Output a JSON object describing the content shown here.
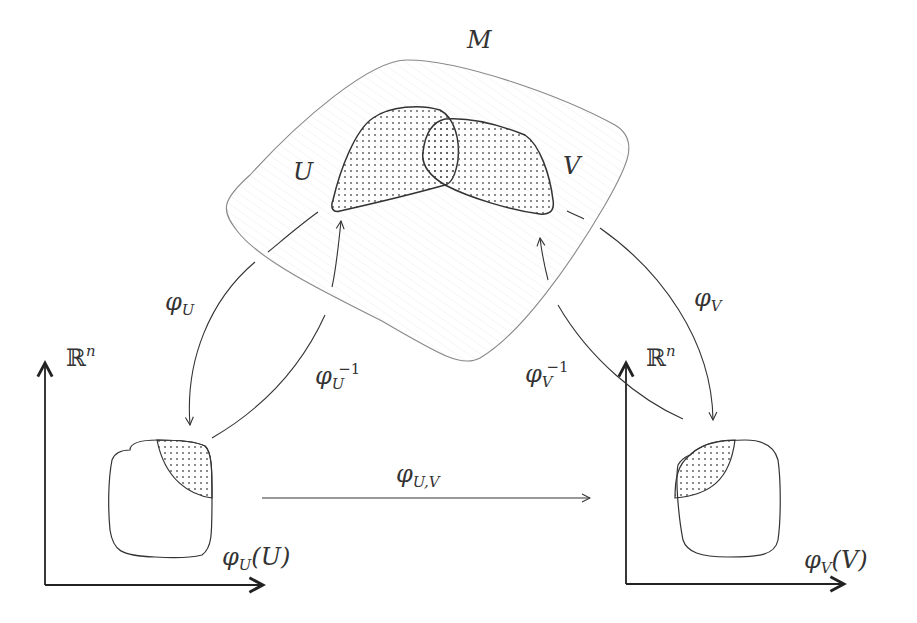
{
  "diagram": {
    "manifold_label": "M",
    "open_set_u_label": "U",
    "open_set_v_label": "V",
    "chart_u": {
      "map": "φ",
      "sub": "U"
    },
    "chart_u_inverse": {
      "map": "φ",
      "sub": "U",
      "sup": "−1"
    },
    "chart_v": {
      "map": "φ",
      "sub": "V"
    },
    "chart_v_inverse": {
      "map": "φ",
      "sub": "V",
      "sup": "−1"
    },
    "transition": {
      "map": "φ",
      "sub": "U,V"
    },
    "left_space": {
      "symbol": "ℝ",
      "sup": "n",
      "image_label": {
        "map": "φ",
        "sub": "U",
        "arg": "(U)"
      }
    },
    "right_space": {
      "symbol": "ℝ",
      "sup": "n",
      "image_label": {
        "map": "φ",
        "sub": "V",
        "arg": "(V)"
      }
    }
  }
}
